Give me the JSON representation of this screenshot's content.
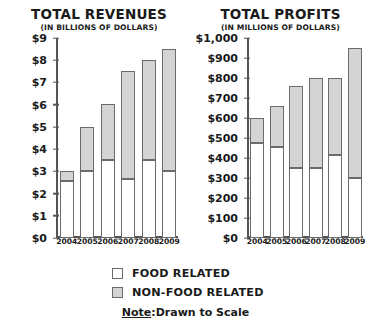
{
  "legend": {
    "items": [
      {
        "label": "FOOD RELATED",
        "key": "food",
        "color": "#ffffff"
      },
      {
        "label": "NON-FOOD RELATED",
        "key": "nonfood",
        "color": "#d4d4d4"
      }
    ],
    "note_word": "Note",
    "note_separator": ":",
    "note_text": "Drawn to Scale"
  },
  "chart_data": [
    {
      "type": "bar",
      "id": "total-revenues",
      "title": "TOTAL REVENUES",
      "subtitle": "(IN BILLIONS OF DOLLARS)",
      "stacked": true,
      "grid": false,
      "legend_position": "below",
      "xlabel": "",
      "ylabel": "",
      "ylim": [
        0,
        9
      ],
      "ytick_step": 1,
      "ytick_labels": [
        "$0",
        "$1",
        "$2",
        "$3",
        "$4",
        "$5",
        "$6",
        "$7",
        "$8",
        "$9"
      ],
      "ytick_values": [
        0,
        1,
        2,
        3,
        4,
        5,
        6,
        7,
        8,
        9
      ],
      "categories": [
        "2004",
        "2005",
        "2006",
        "2007",
        "2008",
        "2009"
      ],
      "series": [
        {
          "name": "FOOD RELATED",
          "key": "food",
          "color": "#ffffff",
          "values": [
            2.55,
            3.0,
            3.5,
            2.65,
            3.5,
            3.0
          ]
        },
        {
          "name": "NON-FOOD RELATED",
          "key": "nonfood",
          "color": "#d4d4d4",
          "values": [
            0.45,
            2.0,
            2.55,
            4.85,
            4.5,
            5.5
          ]
        }
      ],
      "totals": [
        3.0,
        5.0,
        6.05,
        7.5,
        8.0,
        8.5
      ]
    },
    {
      "type": "bar",
      "id": "total-profits",
      "title": "TOTAL PROFITS",
      "subtitle": "(IN MILLIONS OF DOLLARS)",
      "stacked": true,
      "grid": false,
      "legend_position": "below",
      "xlabel": "",
      "ylabel": "",
      "ylim": [
        0,
        1000
      ],
      "ytick_step": 100,
      "ytick_labels": [
        "$0",
        "$100",
        "$200",
        "$300",
        "$400",
        "$500",
        "$600",
        "$700",
        "$800",
        "$900",
        "$1,000"
      ],
      "ytick_values": [
        0,
        100,
        200,
        300,
        400,
        500,
        600,
        700,
        800,
        900,
        1000
      ],
      "categories": [
        "2004",
        "2005",
        "2006",
        "2007",
        "2008",
        "2009"
      ],
      "series": [
        {
          "name": "FOOD RELATED",
          "key": "food",
          "color": "#ffffff",
          "values": [
            475,
            455,
            350,
            350,
            415,
            300
          ]
        },
        {
          "name": "NON-FOOD RELATED",
          "key": "nonfood",
          "color": "#d4d4d4",
          "values": [
            125,
            205,
            410,
            450,
            385,
            650
          ]
        }
      ],
      "totals": [
        600,
        660,
        760,
        800,
        800,
        950
      ]
    }
  ]
}
